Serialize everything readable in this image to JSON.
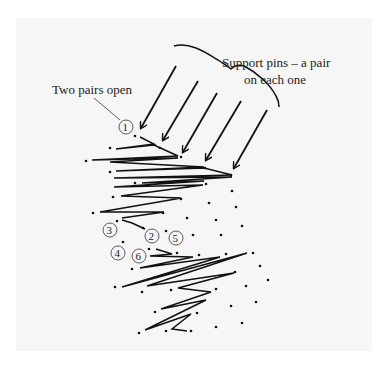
{
  "diagram": {
    "labels": {
      "support_pins_line1": "Support pins – a pair",
      "support_pins_line2": "on each one",
      "two_pairs_open": "Two pairs open"
    },
    "step_markers": [
      "1",
      "2",
      "3",
      "4",
      "5",
      "6"
    ],
    "colors": {
      "background": "#f6f6f6",
      "ink": "#111111"
    }
  }
}
